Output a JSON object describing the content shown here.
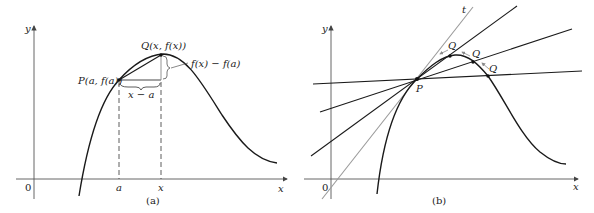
{
  "panel_a": {
    "caption": "(a)",
    "axis_x_label": "x",
    "axis_y_label": "y",
    "origin_label": "0",
    "point_p_label": "P(a, f(a))",
    "point_q_label": "Q(x, f(x))",
    "rise_label": "f(x) − f(a)",
    "run_label": "x − a",
    "tick_a_label": "a",
    "tick_x_label": "x"
  },
  "panel_b": {
    "caption": "(b)",
    "axis_x_label": "x",
    "axis_y_label": "y",
    "origin_label": "0",
    "point_p_label": "P",
    "tangent_label": "t",
    "q_labels": [
      "Q",
      "Q",
      "Q"
    ]
  },
  "colors": {
    "curve": "#1a1a1a",
    "axis": "#555555",
    "tangent": "#9a9a9a",
    "arrow": "#8a8a8a"
  }
}
